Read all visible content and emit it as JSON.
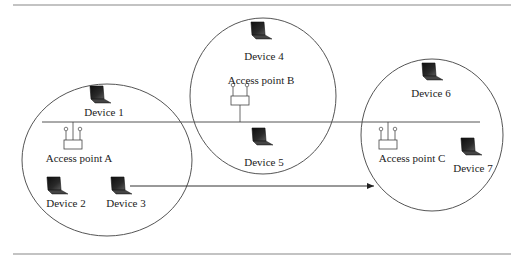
{
  "figure": {
    "type": "wireless network handoff diagram",
    "colors": {
      "line": "#555555",
      "rule": "#888888",
      "laptop_screen": "#1e1e1e",
      "laptop_base": "#3a3a3a",
      "text": "#222222"
    }
  },
  "cells": [
    {
      "id": "A",
      "label": "Access point A"
    },
    {
      "id": "B",
      "label": "Access point B"
    },
    {
      "id": "C",
      "label": "Access point C"
    }
  ],
  "devices": [
    {
      "id": 1,
      "label": "Device 1",
      "cell": "A"
    },
    {
      "id": 2,
      "label": "Device 2",
      "cell": "A"
    },
    {
      "id": 3,
      "label": "Device 3",
      "cell": "A"
    },
    {
      "id": 4,
      "label": "Device 4",
      "cell": "B"
    },
    {
      "id": 5,
      "label": "Device 5",
      "cell": "B"
    },
    {
      "id": 6,
      "label": "Device 6",
      "cell": "C"
    },
    {
      "id": 7,
      "label": "Device 7",
      "cell": "C"
    }
  ],
  "connections": [
    {
      "from": "Access point A",
      "to": "Access point C",
      "type": "wired backbone"
    },
    {
      "from": "Access point B",
      "to": "backbone",
      "type": "wired drop"
    },
    {
      "from": "Device 3",
      "to": "Access point C cell",
      "type": "roaming arrow"
    }
  ]
}
